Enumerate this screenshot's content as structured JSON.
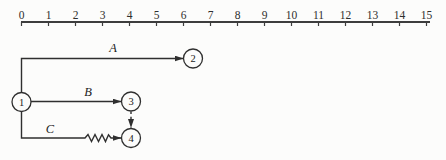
{
  "meta": {
    "background": "#fcfcfb",
    "ink": "#2f2f2f",
    "ruler_ink": "#3d3d3d"
  },
  "ruler": {
    "tick_labels": [
      "0",
      "1",
      "2",
      "3",
      "4",
      "5",
      "6",
      "7",
      "8",
      "9",
      "10",
      "11",
      "12",
      "13",
      "14",
      "15"
    ],
    "x_start": 21.5,
    "x_end": 426.5,
    "line_x_end": 430,
    "y": 22,
    "tick_len": 4,
    "label_baseline_y": 18.5
  },
  "nodes": [
    {
      "label": "1",
      "cx": 21.5,
      "cy": 102,
      "r": 9.5
    },
    {
      "label": "2",
      "cx": 193,
      "cy": 58.5,
      "r": 9.5
    },
    {
      "label": "3",
      "cx": 131,
      "cy": 101.5,
      "r": 9.5
    },
    {
      "label": "4",
      "cx": 131,
      "cy": 138,
      "r": 9.5
    }
  ],
  "edges": [
    {
      "name": "activity-arrow-A",
      "label": "A",
      "label_x": 113,
      "label_y": 52,
      "dashed": false,
      "points": [
        [
          21.5,
          92.5
        ],
        [
          21.5,
          58.5
        ],
        [
          183,
          58.5
        ]
      ]
    },
    {
      "name": "activity-arrow-B",
      "label": "B",
      "label_x": 88,
      "label_y": 96,
      "dashed": false,
      "points": [
        [
          31,
          101.5
        ],
        [
          121,
          101.5
        ]
      ]
    },
    {
      "name": "activity-arrow-C",
      "label": "C",
      "label_x": 50,
      "label_y": 132.5,
      "dashed": false,
      "points": [
        [
          21.5,
          111.5
        ],
        [
          21.5,
          138
        ],
        [
          85,
          138
        ],
        [
          88,
          134.5
        ],
        [
          91.5,
          141.5
        ],
        [
          95,
          134.5
        ],
        [
          98.5,
          141.5
        ],
        [
          102,
          134.5
        ],
        [
          105.5,
          141.5
        ],
        [
          108.5,
          134.8
        ],
        [
          111,
          138
        ],
        [
          121,
          138
        ]
      ]
    },
    {
      "name": "dummy-arrow-3-4",
      "label": "",
      "label_x": 0,
      "label_y": 0,
      "dashed": true,
      "points": [
        [
          131,
          111.5
        ],
        [
          131,
          127.5
        ]
      ]
    }
  ]
}
